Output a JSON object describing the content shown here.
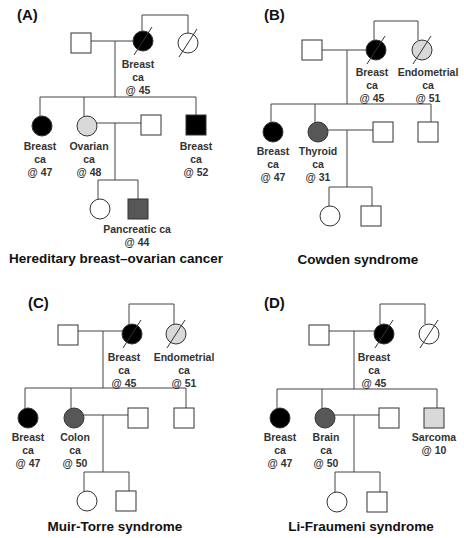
{
  "colors": {
    "affected_breast": "#000000",
    "affected_other": "#575757",
    "affected_light": "#d9d9d9",
    "unaffected": "#ffffff"
  },
  "panels": [
    {
      "label": "(A)",
      "title": "Hereditary breast–ovarian cancer",
      "label_pos": [
        17,
        20
      ],
      "title_pos": [
        116,
        263
      ],
      "lines": [
        [
          91,
          41,
          133,
          41
        ],
        [
          115,
          41,
          115,
          97
        ],
        [
          142,
          31,
          142,
          15
        ],
        [
          142,
          15,
          188,
          15
        ],
        [
          188,
          15,
          188,
          33
        ],
        [
          40,
          97,
          196,
          97
        ],
        [
          40,
          97,
          40,
          116
        ],
        [
          84,
          97,
          84,
          116
        ],
        [
          196,
          97,
          196,
          116
        ],
        [
          97,
          123,
          142,
          123
        ],
        [
          115,
          123,
          115,
          180
        ],
        [
          98,
          180,
          138,
          180
        ],
        [
          98,
          180,
          98,
          199
        ],
        [
          138,
          180,
          138,
          199
        ]
      ],
      "individuals": [
        {
          "shape": "square",
          "x": 81,
          "y": 43,
          "fill": "unaffected"
        },
        {
          "shape": "circle",
          "x": 143,
          "y": 41,
          "fill": "affected_breast",
          "deceased": true,
          "annot": [
            "Breast",
            "ca",
            "@ 45"
          ],
          "annot_x": 138,
          "annot_y": 68
        },
        {
          "shape": "circle",
          "x": 188,
          "y": 43,
          "fill": "unaffected",
          "deceased": true
        },
        {
          "shape": "circle",
          "x": 42,
          "y": 126,
          "fill": "affected_breast",
          "annot": [
            "Breast",
            "ca",
            "@ 47"
          ],
          "annot_x": 40,
          "annot_y": 150
        },
        {
          "shape": "circle",
          "x": 87,
          "y": 126,
          "fill": "affected_light",
          "annot": [
            "Ovarian",
            "ca",
            "@ 48"
          ],
          "annot_x": 89,
          "annot_y": 150
        },
        {
          "shape": "square",
          "x": 151,
          "y": 125,
          "fill": "unaffected"
        },
        {
          "shape": "square",
          "x": 196,
          "y": 125,
          "fill": "affected_breast",
          "annot": [
            "Breast",
            "ca",
            "@ 52"
          ],
          "annot_x": 196,
          "annot_y": 150
        },
        {
          "shape": "circle",
          "x": 100,
          "y": 209,
          "fill": "unaffected"
        },
        {
          "shape": "square",
          "x": 138,
          "y": 209,
          "fill": "affected_other",
          "annot": [
            "Pancreatic ca",
            "@ 44"
          ],
          "annot_x": 137,
          "annot_y": 233
        }
      ]
    },
    {
      "label": "(B)",
      "title": "Cowden syndrome",
      "label_pos": [
        264,
        20
      ],
      "title_pos": [
        358,
        264
      ],
      "lines": [
        [
          321,
          50,
          366,
          50
        ],
        [
          347,
          50,
          347,
          104
        ],
        [
          374,
          40,
          374,
          21
        ],
        [
          374,
          21,
          418,
          21
        ],
        [
          418,
          21,
          418,
          40
        ],
        [
          271,
          104,
          431,
          104
        ],
        [
          271,
          104,
          271,
          122
        ],
        [
          315,
          104,
          315,
          122
        ],
        [
          431,
          104,
          431,
          123
        ],
        [
          328,
          130,
          373,
          130
        ],
        [
          347,
          130,
          347,
          187
        ],
        [
          329,
          187,
          372,
          187
        ],
        [
          329,
          187,
          329,
          206
        ],
        [
          372,
          187,
          372,
          206
        ]
      ],
      "individuals": [
        {
          "shape": "square",
          "x": 312,
          "y": 50,
          "fill": "unaffected"
        },
        {
          "shape": "circle",
          "x": 376,
          "y": 50,
          "fill": "affected_breast",
          "deceased": true,
          "annot": [
            "Breast",
            "ca",
            "@ 45"
          ],
          "annot_x": 372,
          "annot_y": 76
        },
        {
          "shape": "circle",
          "x": 422,
          "y": 50,
          "fill": "affected_light",
          "deceased": true,
          "annot": [
            "Endometrial",
            "ca",
            "@ 51"
          ],
          "annot_x": 428,
          "annot_y": 76
        },
        {
          "shape": "circle",
          "x": 273,
          "y": 132,
          "fill": "affected_breast",
          "annot": [
            "Breast",
            "ca",
            "@ 47"
          ],
          "annot_x": 273,
          "annot_y": 155
        },
        {
          "shape": "circle",
          "x": 318,
          "y": 132,
          "fill": "affected_other",
          "annot": [
            "Thyroid",
            "ca",
            "@ 31"
          ],
          "annot_x": 318,
          "annot_y": 155
        },
        {
          "shape": "square",
          "x": 383,
          "y": 132,
          "fill": "unaffected"
        },
        {
          "shape": "square",
          "x": 428,
          "y": 132,
          "fill": "unaffected"
        },
        {
          "shape": "circle",
          "x": 330,
          "y": 216,
          "fill": "unaffected"
        },
        {
          "shape": "square",
          "x": 371,
          "y": 216,
          "fill": "unaffected"
        }
      ]
    },
    {
      "label": "(C)",
      "title": "Muir-Torre syndrome",
      "label_pos": [
        28,
        308
      ],
      "title_pos": [
        115,
        531
      ],
      "lines": [
        [
          77,
          331,
          122,
          331
        ],
        [
          103,
          331,
          103,
          388
        ],
        [
          129,
          324,
          129,
          304
        ],
        [
          129,
          304,
          174,
          304
        ],
        [
          174,
          304,
          174,
          324
        ],
        [
          25,
          388,
          186,
          388
        ],
        [
          25,
          388,
          25,
          408
        ],
        [
          71,
          388,
          71,
          408
        ],
        [
          186,
          388,
          186,
          408
        ],
        [
          84,
          415,
          129,
          415
        ],
        [
          103,
          415,
          103,
          472
        ],
        [
          84,
          472,
          129,
          472
        ],
        [
          84,
          472,
          84,
          491
        ],
        [
          129,
          472,
          129,
          491
        ]
      ],
      "individuals": [
        {
          "shape": "square",
          "x": 68,
          "y": 335,
          "fill": "unaffected"
        },
        {
          "shape": "circle",
          "x": 132,
          "y": 334,
          "fill": "affected_breast",
          "deceased": true,
          "annot": [
            "Breast",
            "ca",
            "@ 45"
          ],
          "annot_x": 124,
          "annot_y": 361
        },
        {
          "shape": "circle",
          "x": 176,
          "y": 334,
          "fill": "affected_light",
          "deceased": true,
          "annot": [
            "Endometrial",
            "ca",
            "@ 51"
          ],
          "annot_x": 184,
          "annot_y": 361
        },
        {
          "shape": "circle",
          "x": 28,
          "y": 418,
          "fill": "affected_breast",
          "annot": [
            "Breast",
            "ca",
            "@ 47"
          ],
          "annot_x": 28,
          "annot_y": 441
        },
        {
          "shape": "circle",
          "x": 74,
          "y": 418,
          "fill": "affected_other",
          "annot": [
            "Colon",
            "ca",
            "@ 50"
          ],
          "annot_x": 75,
          "annot_y": 441
        },
        {
          "shape": "square",
          "x": 138,
          "y": 418,
          "fill": "unaffected"
        },
        {
          "shape": "square",
          "x": 184,
          "y": 418,
          "fill": "unaffected"
        },
        {
          "shape": "circle",
          "x": 87,
          "y": 501,
          "fill": "unaffected"
        },
        {
          "shape": "square",
          "x": 126,
          "y": 501,
          "fill": "unaffected"
        }
      ]
    },
    {
      "label": "(D)",
      "title": "Li-Fraumeni syndrome",
      "label_pos": [
        264,
        308
      ],
      "title_pos": [
        361,
        531
      ],
      "lines": [
        [
          328,
          331,
          374,
          331
        ],
        [
          354,
          331,
          354,
          389
        ],
        [
          380,
          324,
          380,
          304
        ],
        [
          380,
          304,
          425,
          304
        ],
        [
          425,
          304,
          425,
          324
        ],
        [
          277,
          389,
          437,
          389
        ],
        [
          277,
          389,
          277,
          408
        ],
        [
          322,
          389,
          322,
          408
        ],
        [
          437,
          389,
          437,
          408
        ],
        [
          335,
          415,
          379,
          415
        ],
        [
          354,
          415,
          354,
          472
        ],
        [
          335,
          472,
          380,
          472
        ],
        [
          335,
          472,
          335,
          492
        ],
        [
          380,
          472,
          380,
          492
        ]
      ],
      "individuals": [
        {
          "shape": "square",
          "x": 319,
          "y": 335,
          "fill": "unaffected"
        },
        {
          "shape": "circle",
          "x": 384,
          "y": 334,
          "fill": "affected_breast",
          "deceased": true,
          "annot": [
            "Breast",
            "ca",
            "@ 45"
          ],
          "annot_x": 374,
          "annot_y": 361
        },
        {
          "shape": "circle",
          "x": 429,
          "y": 334,
          "fill": "unaffected",
          "deceased": true
        },
        {
          "shape": "circle",
          "x": 280,
          "y": 418,
          "fill": "affected_breast",
          "annot": [
            "Breast",
            "ca",
            "@ 47"
          ],
          "annot_x": 280,
          "annot_y": 441
        },
        {
          "shape": "circle",
          "x": 325,
          "y": 418,
          "fill": "affected_other",
          "annot": [
            "Brain",
            "ca",
            "@ 50"
          ],
          "annot_x": 326,
          "annot_y": 441
        },
        {
          "shape": "square",
          "x": 389,
          "y": 418,
          "fill": "unaffected"
        },
        {
          "shape": "square",
          "x": 434,
          "y": 418,
          "fill": "affected_light",
          "annot": [
            "Sarcoma",
            "@ 10"
          ],
          "annot_x": 434,
          "annot_y": 441
        }
      ]
    }
  ],
  "panel_d_gen3": [
    {
      "shape": "circle",
      "x": 337,
      "y": 502,
      "fill": "unaffected"
    },
    {
      "shape": "square",
      "x": 377,
      "y": 502,
      "fill": "unaffected"
    }
  ]
}
